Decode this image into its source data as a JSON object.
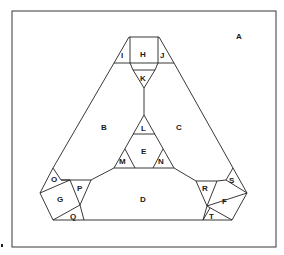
{
  "diagram": {
    "type": "region-map",
    "corner_mark": "•",
    "regions": [
      {
        "id": "A",
        "label": "A"
      },
      {
        "id": "B",
        "label": "B"
      },
      {
        "id": "C",
        "label": "C"
      },
      {
        "id": "D",
        "label": "D"
      },
      {
        "id": "E",
        "label": "E"
      },
      {
        "id": "F",
        "label": "F"
      },
      {
        "id": "G",
        "label": "G"
      },
      {
        "id": "H",
        "label": "H"
      },
      {
        "id": "I",
        "label": "I"
      },
      {
        "id": "J",
        "label": "J"
      },
      {
        "id": "K",
        "label": "K"
      },
      {
        "id": "L",
        "label": "L"
      },
      {
        "id": "M",
        "label": "M"
      },
      {
        "id": "N",
        "label": "N"
      },
      {
        "id": "O",
        "label": "O"
      },
      {
        "id": "P",
        "label": "P"
      },
      {
        "id": "Q",
        "label": "Q"
      },
      {
        "id": "R",
        "label": "R"
      },
      {
        "id": "S",
        "label": "S"
      },
      {
        "id": "T",
        "label": "T"
      }
    ]
  }
}
